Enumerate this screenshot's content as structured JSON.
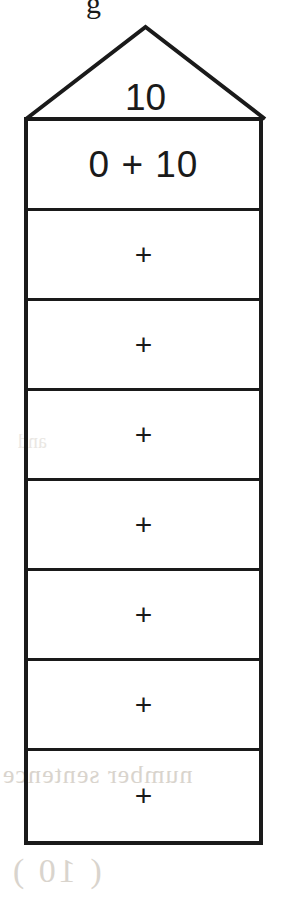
{
  "worksheet": {
    "shape": "house",
    "roof": {
      "label": "10"
    },
    "rows": [
      {
        "text": "0 + 10",
        "kind": "expression"
      },
      {
        "text": "+",
        "kind": "operator"
      },
      {
        "text": "+",
        "kind": "operator"
      },
      {
        "text": "+",
        "kind": "operator"
      },
      {
        "text": "+",
        "kind": "operator"
      },
      {
        "text": "+",
        "kind": "operator"
      },
      {
        "text": "+",
        "kind": "operator"
      },
      {
        "text": "+",
        "kind": "operator"
      }
    ],
    "colors": {
      "ink": "#1a1a1a",
      "paper": "#ffffff",
      "bleed_through": "#d9d4cd"
    },
    "artifacts": {
      "top_fragment": "g",
      "bleed_line_1": "number sentence",
      "bleed_line_2": "( 10 )",
      "bleed_line_3": "and"
    }
  }
}
